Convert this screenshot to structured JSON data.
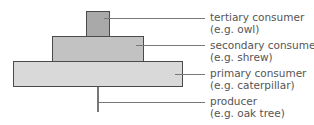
{
  "diagram": {
    "type": "pyramid of numbers",
    "levels": [
      {
        "name": "tertiary consumer",
        "example": "(e.g. owl)",
        "color": "#a9a9a9"
      },
      {
        "name": "secondary consumer",
        "example": "(e.g. shrew)",
        "color": "#c2c2c2"
      },
      {
        "name": "primary consumer",
        "example": "(e.g. caterpillar)",
        "color": "#d9d9d9"
      },
      {
        "name": "producer",
        "example": "(e.g. oak tree)",
        "color": "#ffffff"
      }
    ]
  }
}
